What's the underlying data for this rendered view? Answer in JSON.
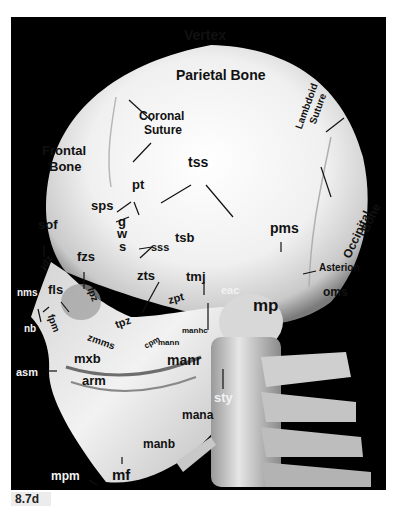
{
  "figure": {
    "caption": "8.7d",
    "background": "#000000",
    "bone_color": "#e9e9e9",
    "label_color": "#111111"
  },
  "labels": {
    "vertex": "Vertex",
    "parietal_bone": "Parietal Bone",
    "coronal_suture_1": "Coronal",
    "coronal_suture_2": "Suture",
    "frontal_bone_1": "Frontal",
    "frontal_bone_2": "Bone",
    "lambdoid_suture_1": "Lambdoid",
    "lambdoid_suture_2": "Suture",
    "occipital_bone_1": "Occipital",
    "occipital_bone_2": "Bone",
    "tss": "tss",
    "pt": "pt",
    "sps": "sps",
    "sof": "sof",
    "g": "g",
    "w": "w",
    "s": "s",
    "sss": "sss",
    "tsb": "tsb",
    "pms": "pms",
    "asterion": "Asterion",
    "oms": "oms",
    "fzs": "fzs",
    "zpf": "zpf",
    "fpz": "fpz",
    "fpm": "fpm",
    "nms": "nms",
    "fls": "fls",
    "nb": "nb",
    "zts": "zts",
    "tmj": "tmj",
    "eac": "eac",
    "zpt": "zpt",
    "mp": "mp",
    "tpz": "tpz",
    "zmms": "zmms",
    "cpm": "cpm",
    "mann": "mann",
    "manhc": "manhc",
    "manr": "manr",
    "mxb": "mxb",
    "asm": "asm",
    "arm": "arm",
    "sty": "sty",
    "mana": "mana",
    "manb": "manb",
    "mpm": "mpm",
    "mf": "mf"
  }
}
